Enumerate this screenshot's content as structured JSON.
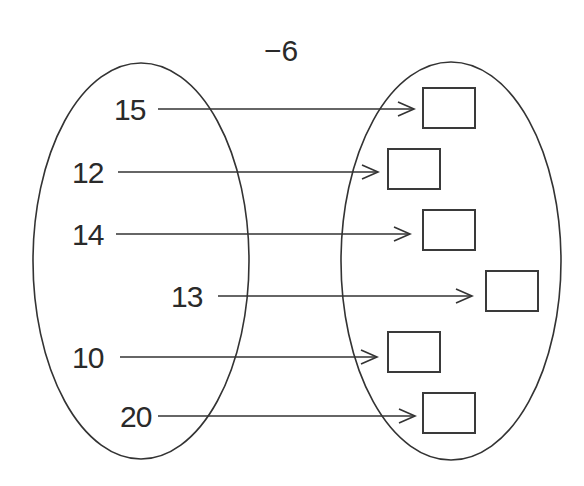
{
  "diagram": {
    "operation": "−6",
    "stroke_color": "#333333",
    "input_set": {
      "values": [
        "15",
        "12",
        "14",
        "13",
        "10",
        "20"
      ]
    },
    "output_set": {
      "boxes": [
        "",
        "",
        "",
        "",
        "",
        ""
      ]
    },
    "mappings": [
      {
        "from": "15",
        "to": ""
      },
      {
        "from": "12",
        "to": ""
      },
      {
        "from": "14",
        "to": ""
      },
      {
        "from": "13",
        "to": ""
      },
      {
        "from": "10",
        "to": ""
      },
      {
        "from": "20",
        "to": ""
      }
    ]
  }
}
